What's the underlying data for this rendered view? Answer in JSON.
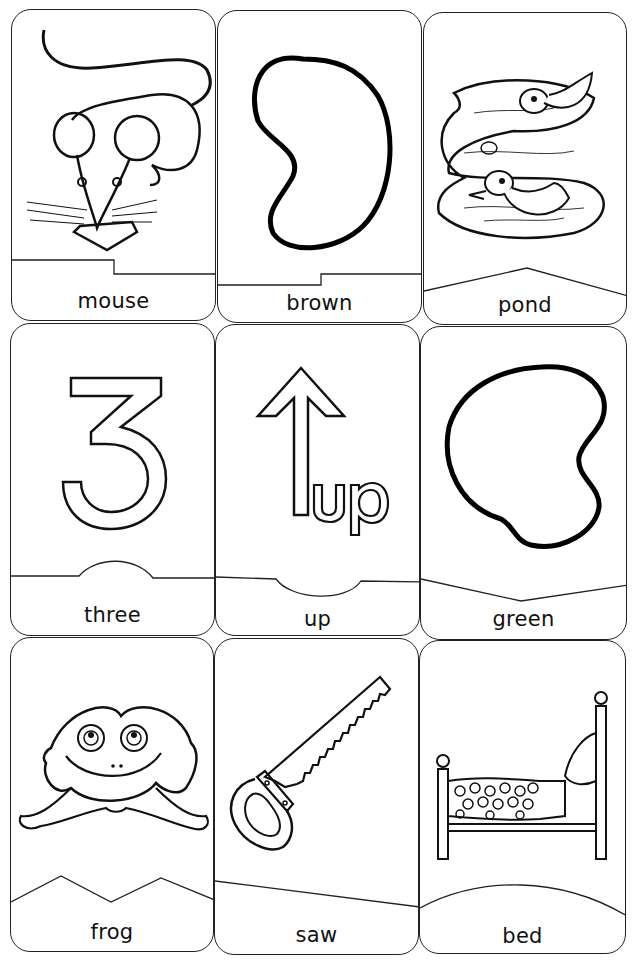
{
  "sheet": {
    "title": "Picture word flashcards",
    "columns": 3,
    "rows": 3,
    "line_color": "#222222",
    "background": "#ffffff"
  },
  "cards": [
    {
      "word": "mouse",
      "picture": "mouse-with-cheese",
      "divider": "step-up"
    },
    {
      "word": "brown",
      "picture": "bean-shape-outline",
      "divider": "step-down"
    },
    {
      "word": "pond",
      "picture": "pond-with-ducks-and-fish",
      "divider": "peak"
    },
    {
      "word": "three",
      "picture": "number-3-outline",
      "divider": "bump-up"
    },
    {
      "word": "up",
      "picture": "up-arrow-with-word-up",
      "divider": "bump-down"
    },
    {
      "word": "green",
      "picture": "blob-shape-outline",
      "divider": "valley"
    },
    {
      "word": "frog",
      "picture": "smiling-frog",
      "divider": "zigzag"
    },
    {
      "word": "saw",
      "picture": "hand-saw",
      "divider": "slant"
    },
    {
      "word": "bed",
      "picture": "bed-with-polka-dot-blanket",
      "divider": "arc"
    }
  ]
}
